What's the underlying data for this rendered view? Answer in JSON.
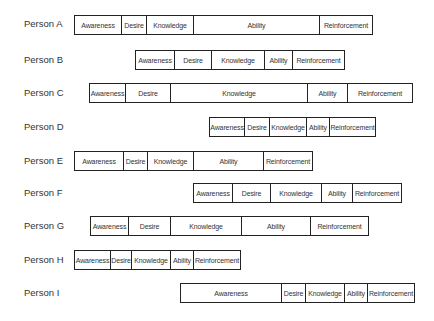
{
  "diagram": {
    "stage_names": [
      "Awareness",
      "Desire",
      "Knowledge",
      "Ability",
      "Reinforcement"
    ],
    "rows": [
      {
        "person": "Person A",
        "label_y": 18,
        "bar_y": 15,
        "segments": [
          {
            "label": "Awareness",
            "x0": 74,
            "x1": 121
          },
          {
            "label": "Desire",
            "x0": 121,
            "x1": 146
          },
          {
            "label": "Knowledge",
            "x0": 146,
            "x1": 193
          },
          {
            "label": "Ability",
            "x0": 193,
            "x1": 319
          },
          {
            "label": "Reinforcement",
            "x0": 319,
            "x1": 372
          }
        ]
      },
      {
        "person": "Person B",
        "label_y": 54,
        "bar_y": 50,
        "segments": [
          {
            "label": "Awareness",
            "x0": 135,
            "x1": 174
          },
          {
            "label": "Desire",
            "x0": 174,
            "x1": 211
          },
          {
            "label": "Knowledge",
            "x0": 211,
            "x1": 264
          },
          {
            "label": "Ability",
            "x0": 264,
            "x1": 292
          },
          {
            "label": "Reinforcement",
            "x0": 292,
            "x1": 344
          }
        ]
      },
      {
        "person": "Person C",
        "label_y": 87,
        "bar_y": 83,
        "segments": [
          {
            "label": "Awareness",
            "x0": 89,
            "x1": 125
          },
          {
            "label": "Desire",
            "x0": 125,
            "x1": 170
          },
          {
            "label": "Knowledge",
            "x0": 170,
            "x1": 307
          },
          {
            "label": "Ability",
            "x0": 307,
            "x1": 347
          },
          {
            "label": "Reinforcement",
            "x0": 347,
            "x1": 412
          }
        ]
      },
      {
        "person": "Person D",
        "label_y": 121,
        "bar_y": 117,
        "segments": [
          {
            "label": "Awareness",
            "x0": 209,
            "x1": 244
          },
          {
            "label": "Desire",
            "x0": 244,
            "x1": 269
          },
          {
            "label": "Knowledge",
            "x0": 269,
            "x1": 306
          },
          {
            "label": "Ability",
            "x0": 306,
            "x1": 329
          },
          {
            "label": "Reinforcement",
            "x0": 329,
            "x1": 375
          }
        ]
      },
      {
        "person": "Person E",
        "label_y": 155,
        "bar_y": 151,
        "segments": [
          {
            "label": "Awareness",
            "x0": 74,
            "x1": 123
          },
          {
            "label": "Desire",
            "x0": 123,
            "x1": 147
          },
          {
            "label": "Knowledge",
            "x0": 147,
            "x1": 193
          },
          {
            "label": "Ability",
            "x0": 193,
            "x1": 263
          },
          {
            "label": "Reinforcement",
            "x0": 263,
            "x1": 312
          }
        ]
      },
      {
        "person": "Person F",
        "label_y": 187,
        "bar_y": 183,
        "segments": [
          {
            "label": "Awareness",
            "x0": 193,
            "x1": 232
          },
          {
            "label": "Desire",
            "x0": 232,
            "x1": 270
          },
          {
            "label": "Knowledge",
            "x0": 270,
            "x1": 321
          },
          {
            "label": "Ability",
            "x0": 321,
            "x1": 352
          },
          {
            "label": "Reinforcement",
            "x0": 352,
            "x1": 401
          }
        ]
      },
      {
        "person": "Person G",
        "label_y": 220,
        "bar_y": 216,
        "segments": [
          {
            "label": "Awareness",
            "x0": 90,
            "x1": 128
          },
          {
            "label": "Desire",
            "x0": 128,
            "x1": 170
          },
          {
            "label": "Knowledge",
            "x0": 170,
            "x1": 241
          },
          {
            "label": "Ability",
            "x0": 241,
            "x1": 310
          },
          {
            "label": "Reinforcement",
            "x0": 310,
            "x1": 368
          }
        ]
      },
      {
        "person": "Person H",
        "label_y": 254,
        "bar_y": 250,
        "segments": [
          {
            "label": "Awareness",
            "x0": 74,
            "x1": 110
          },
          {
            "label": "Desire",
            "x0": 110,
            "x1": 131
          },
          {
            "label": "Knowledge",
            "x0": 131,
            "x1": 170
          },
          {
            "label": "Ability",
            "x0": 170,
            "x1": 193
          },
          {
            "label": "Reinforcement",
            "x0": 193,
            "x1": 240
          }
        ]
      },
      {
        "person": "Person I",
        "label_y": 287,
        "bar_y": 283,
        "segments": [
          {
            "label": "Awareness",
            "x0": 180,
            "x1": 281
          },
          {
            "label": "Desire",
            "x0": 281,
            "x1": 305
          },
          {
            "label": "Knowledge",
            "x0": 305,
            "x1": 344
          },
          {
            "label": "Ability",
            "x0": 344,
            "x1": 367
          },
          {
            "label": "Reinforcement",
            "x0": 367,
            "x1": 414
          }
        ]
      }
    ]
  },
  "colors": {
    "background": "#ffffff",
    "border": "#222222",
    "text": "#333333"
  }
}
